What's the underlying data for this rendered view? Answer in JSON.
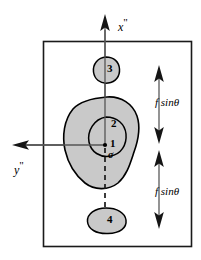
{
  "figure": {
    "type": "diagram",
    "frame": {
      "x": 43,
      "y": 41,
      "width": 149,
      "height": 206,
      "border_color": "#1a1a1a"
    },
    "colors": {
      "blob_fill": "#c9c9c9",
      "outline": "#000000",
      "axis": "#4d4d4d",
      "text": "#000000",
      "background": "#ffffff"
    },
    "axes": {
      "x_label": "x",
      "x_prime": "\"",
      "y_label": "y",
      "y_prime": "\"",
      "x_axis_direction": "up",
      "y_axis_direction": "left",
      "origin": {
        "x": 105,
        "y": 145
      }
    },
    "regions": [
      {
        "id": "region-1",
        "label": "1",
        "shape": "inner-oval",
        "filled": true
      },
      {
        "id": "region-2",
        "label": "2",
        "shape": "large-blob",
        "filled": true
      },
      {
        "id": "region-3",
        "label": "3",
        "shape": "small-blob-top",
        "filled": true
      },
      {
        "id": "region-4",
        "label": "4",
        "shape": "small-blob-bottom",
        "filled": true
      }
    ],
    "origin_symbol": "σ",
    "dimensions": [
      {
        "id": "dim-top",
        "label": "f sinθ",
        "label_parts": {
          "variable": "f",
          "function": "sinθ"
        },
        "arrow": "double-headed",
        "orientation": "vertical",
        "from_y": 66,
        "to_y": 143
      },
      {
        "id": "dim-bottom",
        "label": "f sinθ",
        "label_parts": {
          "variable": "f",
          "function": "sinθ"
        },
        "arrow": "double-headed",
        "orientation": "vertical",
        "from_y": 150,
        "to_y": 228
      }
    ],
    "dashed_line": {
      "from_y": 148,
      "to_y": 210,
      "x": 105,
      "style": "dashed"
    }
  }
}
